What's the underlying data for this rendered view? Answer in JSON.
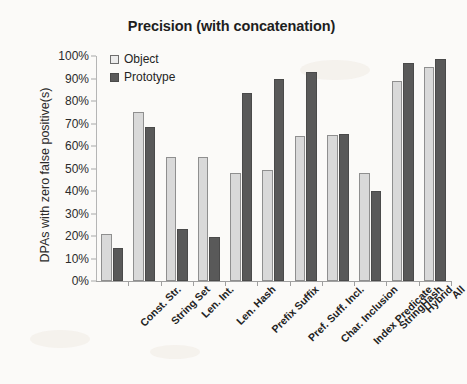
{
  "chart_data": {
    "type": "bar",
    "title": "Precision (with concatenation)",
    "xlabel": "",
    "ylabel": "DPAs  with zero false positive(s)",
    "ylim": [
      0,
      100
    ],
    "ytick_labels": [
      "0%",
      "10%",
      "20%",
      "30%",
      "40%",
      "50%",
      "60%",
      "70%",
      "80%",
      "90%",
      "100%"
    ],
    "ytick_values": [
      0,
      10,
      20,
      30,
      40,
      50,
      60,
      70,
      80,
      90,
      100
    ],
    "grid": false,
    "legend_position": "top-left-inside",
    "categories": [
      "Const. Str.",
      "String Set",
      "Len. Int.",
      "Len. Hash",
      "Prefix Suffix",
      "Pref. Suff. Incl.",
      "Char. Inclusion",
      "Index Predicate",
      "StringHash",
      "Hybrid",
      "All"
    ],
    "series": [
      {
        "name": "Object",
        "color": "#d9d9d9",
        "values": [
          21,
          75,
          55,
          55,
          48,
          49.5,
          64.5,
          65,
          48,
          89,
          95
        ]
      },
      {
        "name": "Prototype",
        "color": "#595959",
        "values": [
          14.5,
          68.5,
          23,
          19.5,
          83.5,
          90,
          93,
          65.5,
          40,
          97,
          98.5
        ]
      }
    ]
  },
  "legend": {
    "items": [
      {
        "label": "Object",
        "swatch": "light-gray-outlined-square"
      },
      {
        "label": "Prototype",
        "swatch": "dark-gray-filled-square"
      }
    ]
  }
}
